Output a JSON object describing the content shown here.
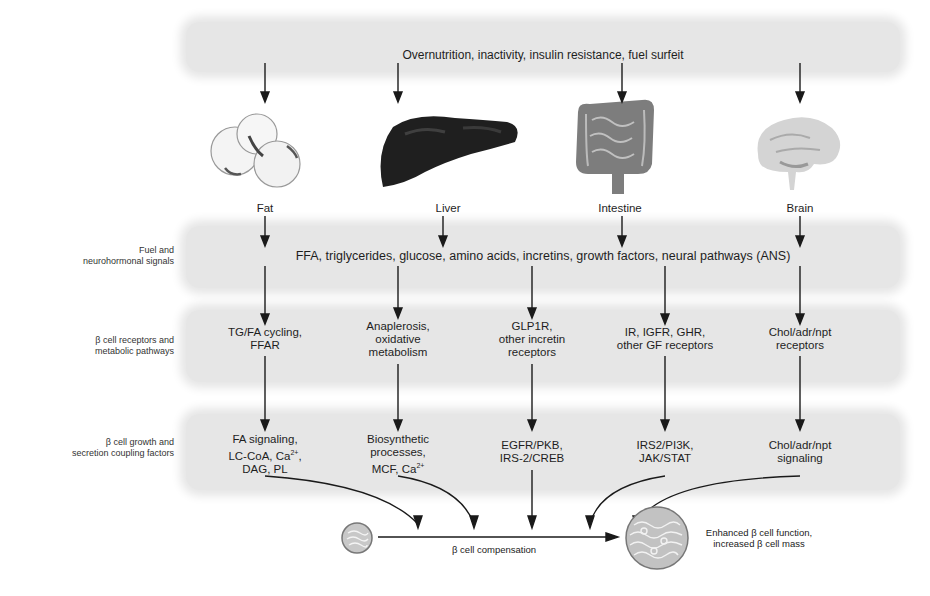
{
  "diagram": {
    "top_band": {
      "text": "Overnutrition, inactivity, insulin resistance, fuel surfeit"
    },
    "organs": [
      {
        "label": "Fat",
        "icon": "fat-cells-icon"
      },
      {
        "label": "Liver",
        "icon": "liver-icon"
      },
      {
        "label": "Intestine",
        "icon": "intestine-icon"
      },
      {
        "label": "Brain",
        "icon": "brain-icon"
      }
    ],
    "rows": [
      {
        "label_line1": "Fuel and",
        "label_line2": "neurohormonal signals",
        "text": "FFA, triglycerides, glucose, amino acids, incretins, growth factors, neural pathways (ANS)"
      },
      {
        "label_line1": "β cell receptors and",
        "label_line2": "metabolic pathways",
        "cells": [
          {
            "line1": "TG/FA cycling,",
            "line2": "FFAR",
            "line3": ""
          },
          {
            "line1": "Anaplerosis,",
            "line2": "oxidative",
            "line3": "metabolism"
          },
          {
            "line1": "GLP1R,",
            "line2": "other incretin",
            "line3": "receptors"
          },
          {
            "line1": "IR, IGFR, GHR,",
            "line2": "other GF receptors",
            "line3": ""
          },
          {
            "line1": "Chol/adr/npt",
            "line2": "receptors",
            "line3": ""
          }
        ]
      },
      {
        "label_line1": "β cell growth and",
        "label_line2": "secretion coupling factors",
        "cells": [
          {
            "line1": "FA signaling,",
            "line2": "LC-CoA, Ca",
            "line2_sup": "2+",
            "line2_after": ",",
            "line3": "DAG, PL"
          },
          {
            "line1": "Biosynthetic",
            "line2": "processes,",
            "line3": "MCF, Ca",
            "line3_sup": "2+"
          },
          {
            "line1": "EGFR/PKB,",
            "line2": "IRS-2/CREB",
            "line3": ""
          },
          {
            "line1": "IRS2/PI3K,",
            "line2": "JAK/STAT",
            "line3": ""
          },
          {
            "line1": "Chol/adr/npt",
            "line2": "signaling",
            "line3": ""
          }
        ]
      }
    ],
    "bottom": {
      "compensation_label": "β cell compensation",
      "outcome_line1": "Enhanced β cell function,",
      "outcome_line2": "increased β cell mass",
      "small_cell_icon": "small-beta-cell-icon",
      "large_cell_icon": "large-beta-cell-icon"
    },
    "colors": {
      "band": "#e6e6e6",
      "line": "#1a1a1a",
      "liver": "#1c1c1c",
      "intestine": "#7a7a7a",
      "brain": "#cfcfcf"
    }
  }
}
